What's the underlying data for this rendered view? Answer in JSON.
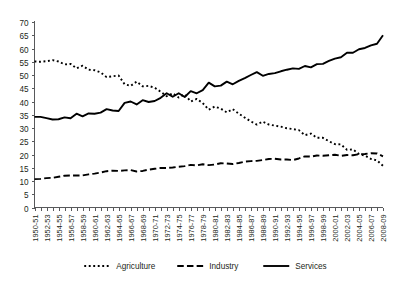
{
  "chart_data": {
    "type": "line",
    "title": "",
    "subtitle": "",
    "xlabel": "",
    "ylabel": "",
    "ylim": [
      0,
      70
    ],
    "ytick_step": 5,
    "grid": false,
    "legend_position": "bottom",
    "yticks": [
      0,
      5,
      10,
      15,
      20,
      25,
      30,
      35,
      40,
      45,
      50,
      55,
      60,
      65,
      70
    ],
    "categories": [
      "1950-51",
      "1951-52",
      "1952-53",
      "1953-54",
      "1954-55",
      "1955-56",
      "1956-57",
      "1957-58",
      "1958-59",
      "1959-60",
      "1960-61",
      "1961-62",
      "1962-63",
      "1963-64",
      "1964-65",
      "1965-66",
      "1966-67",
      "1967-68",
      "1968-69",
      "1969-70",
      "1970-71",
      "1971-72",
      "1972-73",
      "1973-74",
      "1974-75",
      "1975-76",
      "1976-77",
      "1977-78",
      "1978-79",
      "1979-80",
      "1980-81",
      "1981-82",
      "1982-83",
      "1983-84",
      "1984-85",
      "1985-86",
      "1986-87",
      "1987-88",
      "1988-89",
      "1989-90",
      "1990-91",
      "1991-92",
      "1992-93",
      "1993-94",
      "1994-95",
      "1995-96",
      "1996-97",
      "1997-98",
      "1998-99",
      "1999-00",
      "2000-01",
      "2001-02",
      "2002-03",
      "2003-04",
      "2004-05",
      "2005-06",
      "2006-07",
      "2007-08",
      "2008-09"
    ],
    "xtick_labels": [
      "1950-51",
      "1952-53",
      "1954-55",
      "1956-57",
      "1958-59",
      "1960-61",
      "1962-63",
      "1964-65",
      "1966-67",
      "1968-69",
      "1970-71",
      "1972-73",
      "1974-75",
      "1976-77",
      "1978-79",
      "1980-81",
      "1982-83",
      "1984-85",
      "1986-87",
      "1988-89",
      "1990-91",
      "1992-93",
      "1994-95",
      "1996-97",
      "1998-99",
      "2000-01",
      "2002-03",
      "2004-05",
      "2006-07",
      "2008-09"
    ],
    "series": [
      {
        "name": "Agriculture",
        "style": "dotted",
        "values": [
          55.1,
          55.0,
          55.2,
          55.6,
          55.1,
          54.0,
          54.2,
          52.5,
          53.5,
          52.0,
          51.8,
          51.0,
          49.2,
          49.5,
          49.8,
          46.5,
          45.9,
          47.5,
          45.7,
          45.9,
          45.2,
          43.7,
          42.0,
          43.1,
          41.5,
          42.7,
          40.0,
          41.0,
          39.4,
          36.9,
          38.1,
          37.3,
          35.9,
          37.1,
          35.4,
          33.9,
          32.5,
          31.3,
          32.4,
          31.3,
          30.9,
          30.5,
          29.9,
          29.6,
          29.2,
          27.3,
          27.9,
          26.3,
          26.3,
          25.0,
          23.9,
          23.8,
          21.8,
          21.9,
          20.2,
          19.6,
          18.3,
          17.8,
          15.7
        ]
      },
      {
        "name": "Industry",
        "style": "dashed",
        "values": [
          10.7,
          10.8,
          11.1,
          11.2,
          11.6,
          12.0,
          12.1,
          12.1,
          12.1,
          12.5,
          12.8,
          13.2,
          13.7,
          13.9,
          13.8,
          14.0,
          14.1,
          13.6,
          13.8,
          14.3,
          14.6,
          14.9,
          14.9,
          15.1,
          15.4,
          15.6,
          16.1,
          15.9,
          16.3,
          16.0,
          16.2,
          16.7,
          16.6,
          16.4,
          16.8,
          17.3,
          17.5,
          17.6,
          17.9,
          18.3,
          18.4,
          18.1,
          18.1,
          17.9,
          18.5,
          19.3,
          19.2,
          19.6,
          19.5,
          19.7,
          19.9,
          19.5,
          19.8,
          19.7,
          20.1,
          20.2,
          20.5,
          20.4,
          19.3
        ]
      },
      {
        "name": "Services",
        "style": "solid",
        "values": [
          34.2,
          34.2,
          33.7,
          33.2,
          33.3,
          34.0,
          33.7,
          35.4,
          34.4,
          35.5,
          35.4,
          35.8,
          37.1,
          36.6,
          36.4,
          39.5,
          40.0,
          38.9,
          40.5,
          39.8,
          40.2,
          41.4,
          43.1,
          41.8,
          43.1,
          41.7,
          43.9,
          43.1,
          44.3,
          47.1,
          45.7,
          46.0,
          47.5,
          46.5,
          47.8,
          48.8,
          50.0,
          51.1,
          49.7,
          50.4,
          50.7,
          51.4,
          52.0,
          52.5,
          52.3,
          53.4,
          52.9,
          54.1,
          54.2,
          55.3,
          56.2,
          56.7,
          58.4,
          58.4,
          59.7,
          60.2,
          61.2,
          61.8,
          65.0
        ]
      }
    ],
    "legend": [
      {
        "label": "Agriculture",
        "style": "dotted"
      },
      {
        "label": "Industry",
        "style": "dashed"
      },
      {
        "label": "Services",
        "style": "solid"
      }
    ]
  }
}
